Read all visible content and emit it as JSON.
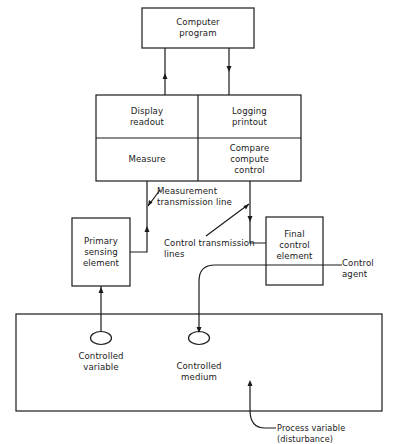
{
  "diagram": {
    "stroke_color": "#1a1a1a",
    "background": "#ffffff",
    "blocks": {
      "computer_program": "Computer\nprogram",
      "display_readout": "Display\nreadout",
      "logging_printout": "Logging\nprintout",
      "measure": "Measure",
      "compare_compute_control": "Compare\ncompute\ncontrol",
      "primary_sensing_element": "Primary\nsensing\nelement",
      "final_control_element": "Final\ncontrol\nelement"
    },
    "labels": {
      "measurement_transmission_line": "Measurement\ntransmission line",
      "control_transmission_lines": "Control  transmission\n         lines",
      "control_agent": "Control\nagent",
      "controlled_variable": "Controlled\nvariable",
      "controlled_medium": "Controlled\nmedium",
      "process_variable": "Process variable (disturbance)"
    }
  }
}
